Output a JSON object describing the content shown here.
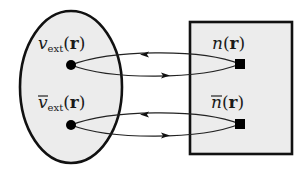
{
  "diagram": {
    "type": "mapping-diagram",
    "colors": {
      "region_fill": "#ededed",
      "stroke": "#111111",
      "background": "#ffffff"
    },
    "left_set": {
      "shape": "ellipse",
      "nodes": [
        {
          "id": "v_ext",
          "symbol": "v",
          "subscript": "ext",
          "arg_open": "(",
          "arg": "r",
          "arg_close": ")",
          "overbar": false,
          "marker": "circle"
        },
        {
          "id": "vbar_ext",
          "symbol": "v",
          "subscript": "ext",
          "arg_open": "(",
          "arg": "r",
          "arg_close": ")",
          "overbar": true,
          "marker": "circle"
        }
      ]
    },
    "right_set": {
      "shape": "rectangle",
      "nodes": [
        {
          "id": "n",
          "symbol": "n",
          "arg_open": "(",
          "arg": "r",
          "arg_close": ")",
          "overbar": false,
          "marker": "square"
        },
        {
          "id": "nbar",
          "symbol": "n",
          "arg_open": "(",
          "arg": "r",
          "arg_close": ")",
          "overbar": true,
          "marker": "square"
        }
      ]
    },
    "edges": [
      {
        "from": "n",
        "to": "v_ext",
        "direction": "left"
      },
      {
        "from": "v_ext",
        "to": "n",
        "direction": "right"
      },
      {
        "from": "nbar",
        "to": "vbar_ext",
        "direction": "left"
      },
      {
        "from": "vbar_ext",
        "to": "nbar",
        "direction": "right"
      }
    ]
  }
}
